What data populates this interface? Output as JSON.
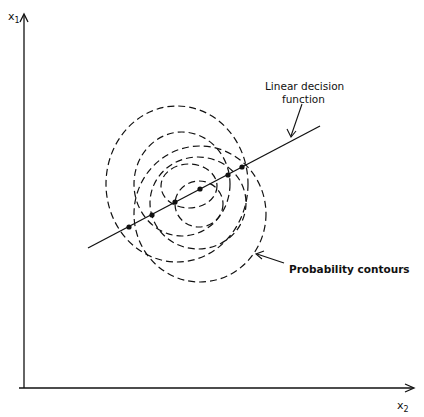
{
  "diagram": {
    "axes": {
      "y_label": "x",
      "y_label_sub": "1",
      "x_label": "x",
      "x_label_sub": "2"
    },
    "annotations": {
      "line_label_line1": "Linear decision",
      "line_label_line2": "function",
      "contours_label": "Probability contours"
    },
    "colors": {
      "ink": "#111111",
      "background": "#ffffff"
    }
  }
}
